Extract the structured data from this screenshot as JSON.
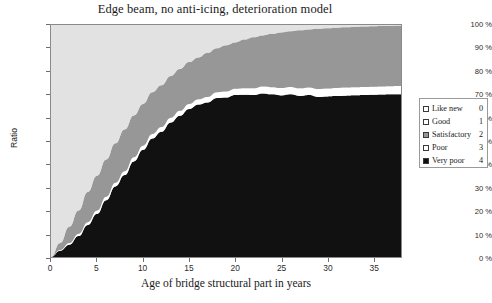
{
  "chart_data": {
    "type": "area",
    "stacked": true,
    "title": "Edge beam, no anti-icing, deterioration model",
    "xlabel": "Age of bridge structural part in years",
    "ylabel": "Ratio",
    "xlim": [
      0,
      38
    ],
    "ylim": [
      0,
      100
    ],
    "grid": false,
    "legend_position": "right",
    "x_ticks": [
      0,
      5,
      10,
      15,
      20,
      25,
      30,
      35
    ],
    "x_tick_labels": [
      "0",
      "5",
      "10",
      "15",
      "20",
      "25",
      "30",
      "35"
    ],
    "y_ticks": [
      0,
      10,
      20,
      30,
      40,
      50,
      60,
      70,
      80,
      90,
      100
    ],
    "y_tick_labels": [
      "0 %",
      "10 %",
      "20 %",
      "30 %",
      "40 %",
      "50 %",
      "60 %",
      "70 %",
      "80 %",
      "90 %",
      "100 %"
    ],
    "x": [
      0,
      1,
      2,
      3,
      4,
      5,
      6,
      7,
      8,
      9,
      10,
      11,
      12,
      13,
      14,
      15,
      16,
      17,
      18,
      19,
      20,
      21,
      22,
      23,
      24,
      25,
      26,
      27,
      28,
      29,
      30,
      31,
      32,
      33,
      34,
      35,
      36,
      37,
      38
    ],
    "series": [
      {
        "name": "Like new",
        "state": 0,
        "color": "#e2e2e2",
        "values": [
          100,
          84,
          70,
          59,
          49,
          41,
          35,
          29,
          24,
          20,
          17,
          14,
          12,
          10,
          8,
          7,
          6,
          5,
          4,
          3.5,
          3,
          2.4,
          2,
          1.7,
          1.4,
          1.2,
          1,
          0.8,
          0.7,
          0.6,
          0.5,
          0.4,
          0.35,
          0.3,
          0.25,
          0.2,
          0.17,
          0.14,
          0.12
        ]
      },
      {
        "name": "Good",
        "state": 1,
        "color": "#e2e2e2",
        "values": [
          0,
          10,
          17,
          21,
          23,
          24,
          23,
          22,
          21,
          19,
          17,
          15,
          14,
          12,
          11,
          9,
          8,
          7,
          6,
          5.2,
          4.5,
          3.9,
          3.3,
          2.8,
          2.4,
          2,
          1.7,
          1.5,
          1.2,
          1,
          0.9,
          0.75,
          0.63,
          0.53,
          0.44,
          0.37,
          0.31,
          0.26,
          0.22
        ]
      },
      {
        "name": "Satisfactory",
        "state": 2,
        "color": "#979797",
        "values": [
          0,
          3,
          7,
          10,
          13,
          15,
          16,
          17,
          18,
          18,
          18,
          18,
          18,
          18,
          18,
          18,
          18,
          19,
          19,
          20,
          20,
          21,
          22,
          22,
          23,
          24,
          24,
          25,
          25,
          26,
          26,
          26,
          26,
          26,
          26,
          26,
          26,
          26,
          26
        ]
      },
      {
        "name": "Poor",
        "state": 3,
        "color": "#ffffff",
        "values": [
          0,
          0.3,
          0.7,
          1,
          1.2,
          1.4,
          1.5,
          1.6,
          1.7,
          1.8,
          1.8,
          1.9,
          2,
          2,
          2.1,
          2.2,
          2.3,
          2.4,
          2.5,
          2.6,
          2.7,
          2.8,
          2.9,
          3,
          3.1,
          3.2,
          3.2,
          3.3,
          3.3,
          3.4,
          3.4,
          3.5,
          3.5,
          3.5,
          3.5,
          3.5,
          3.5,
          3.5,
          3.5
        ]
      },
      {
        "name": "Very poor",
        "state": 4,
        "color": "#111111",
        "values": [
          0,
          2.7,
          5.3,
          9,
          13.8,
          18.6,
          24.5,
          30.4,
          35.3,
          41.2,
          46.2,
          51.1,
          54,
          58,
          60.9,
          63.8,
          65.7,
          66.6,
          68.5,
          68.7,
          69.8,
          69.9,
          69.8,
          70.5,
          70.1,
          69.6,
          70.1,
          69.4,
          69.8,
          69,
          69.2,
          69.35,
          69.52,
          69.67,
          69.81,
          69.93,
          70.02,
          70.1,
          70.16
        ]
      }
    ],
    "cumulative_top_of_very_poor": [
      0,
      3,
      6,
      10,
      15,
      20,
      26,
      32,
      37,
      43,
      48,
      53,
      56,
      60,
      63,
      66,
      68,
      69,
      71,
      71.5,
      72.5,
      72.7,
      72.7,
      73.5,
      73.2,
      72.8,
      73.3,
      72.7,
      73.1,
      72.4,
      72.6,
      72.85,
      73.02,
      73.2,
      73.31,
      73.43,
      73.53,
      73.6,
      73.66
    ]
  },
  "legend": {
    "entries": [
      {
        "label": "Like new",
        "value": "0",
        "swatch": "#ffffff"
      },
      {
        "label": "Good",
        "value": "1",
        "swatch": "#ffffff"
      },
      {
        "label": "Satisfactory",
        "value": "2",
        "swatch": "#979797"
      },
      {
        "label": "Poor",
        "value": "3",
        "swatch": "#ffffff"
      },
      {
        "label": "Very poor",
        "value": "4",
        "swatch": "#111111"
      }
    ]
  }
}
